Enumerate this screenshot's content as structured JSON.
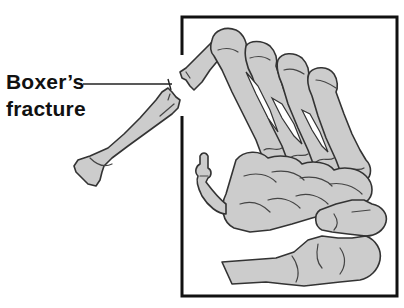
{
  "figure": {
    "type": "anatomical-illustration",
    "label": {
      "line1": "Boxer’s",
      "line2": "fracture"
    },
    "colors": {
      "background": "#ffffff",
      "bone_fill": "#cccccc",
      "bone_outline": "#333333",
      "frame": "#111111",
      "label_text": "#111111"
    }
  }
}
